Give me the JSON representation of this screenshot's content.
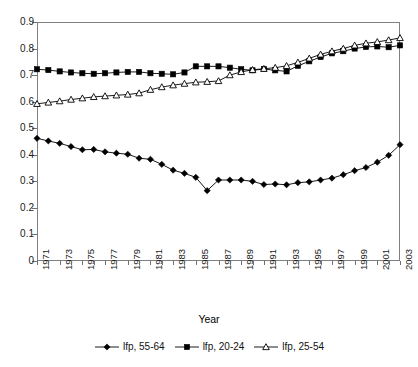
{
  "chart_data": {
    "type": "line",
    "title": "",
    "xlabel": "Year",
    "ylabel": "",
    "ylim": [
      0,
      0.9
    ],
    "ytick_step": 0.1,
    "grid": false,
    "legend_position": "bottom",
    "xlim": [
      1971,
      2003
    ],
    "x": [
      1971,
      1972,
      1973,
      1974,
      1975,
      1976,
      1977,
      1978,
      1979,
      1980,
      1981,
      1982,
      1983,
      1984,
      1985,
      1986,
      1987,
      1988,
      1989,
      1990,
      1991,
      1992,
      1993,
      1994,
      1995,
      1996,
      1997,
      1998,
      1999,
      2000,
      2001,
      2002,
      2003
    ],
    "xtick_labels": [
      "1971",
      "",
      "1973",
      "",
      "1975",
      "",
      "1977",
      "",
      "1979",
      "",
      "1981",
      "",
      "1983",
      "",
      "1985",
      "",
      "1987",
      "",
      "1989",
      "",
      "1991",
      "",
      "1993",
      "",
      "1995",
      "",
      "1997",
      "",
      "1999",
      "",
      "2001",
      "",
      "2003"
    ],
    "ytick_labels": [
      "0",
      "0.1",
      "0.2",
      "0.3",
      "0.4",
      "0.5",
      "0.6",
      "0.7",
      "0.8",
      "0.9"
    ],
    "ytick_values": [
      0,
      0.1,
      0.2,
      0.3,
      0.4,
      0.5,
      0.6,
      0.7,
      0.8,
      0.9
    ],
    "series": [
      {
        "name": "lfp, 55-64",
        "marker": "diamond",
        "filled": true,
        "color": "#000000",
        "values": [
          0.462,
          0.452,
          0.443,
          0.431,
          0.419,
          0.42,
          0.411,
          0.406,
          0.402,
          0.387,
          0.383,
          0.364,
          0.342,
          0.33,
          0.315,
          0.265,
          0.305,
          0.305,
          0.305,
          0.3,
          0.288,
          0.29,
          0.287,
          0.295,
          0.298,
          0.305,
          0.312,
          0.325,
          0.34,
          0.352,
          0.372,
          0.398,
          0.438
        ]
      },
      {
        "name": "lfp, 20-24",
        "marker": "square",
        "filled": true,
        "color": "#000000",
        "values": [
          0.722,
          0.719,
          0.714,
          0.71,
          0.707,
          0.705,
          0.707,
          0.71,
          0.712,
          0.712,
          0.707,
          0.705,
          0.703,
          0.71,
          0.733,
          0.733,
          0.733,
          0.728,
          0.722,
          0.718,
          0.723,
          0.718,
          0.714,
          0.735,
          0.752,
          0.768,
          0.782,
          0.79,
          0.8,
          0.806,
          0.808,
          0.805,
          0.812
        ]
      },
      {
        "name": "lfp, 25-54",
        "marker": "triangle",
        "filled": false,
        "color": "#000000",
        "values": [
          0.592,
          0.597,
          0.602,
          0.608,
          0.613,
          0.618,
          0.621,
          0.624,
          0.627,
          0.632,
          0.645,
          0.655,
          0.662,
          0.668,
          0.673,
          0.675,
          0.678,
          0.7,
          0.712,
          0.72,
          0.724,
          0.728,
          0.735,
          0.748,
          0.763,
          0.778,
          0.79,
          0.8,
          0.812,
          0.82,
          0.825,
          0.832,
          0.84
        ]
      }
    ]
  },
  "legend": {
    "items": [
      {
        "label": "lfp, 55-64",
        "marker": "diamond"
      },
      {
        "label": "lfp, 20-24",
        "marker": "square"
      },
      {
        "label": "lfp, 25-54",
        "marker": "triangle"
      }
    ]
  },
  "axis": {
    "x_title": "Year"
  }
}
